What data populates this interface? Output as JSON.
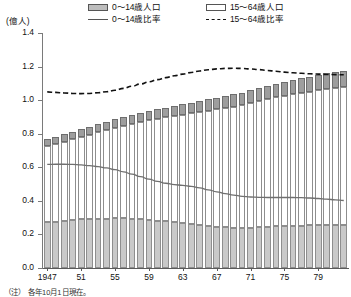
{
  "axis": {
    "unit_label": "(億人)",
    "y_ticks": [
      "1.4",
      "1.2",
      "1.0",
      "0.8",
      "0.6",
      "0.4",
      "0.2",
      "0.0"
    ],
    "x_ticks": [
      "1947",
      "51",
      "55",
      "59",
      "63",
      "67",
      "71",
      "75",
      "79"
    ]
  },
  "legend": {
    "items": [
      {
        "label": "0〜14歳人口",
        "icon": "filled-box-swatch"
      },
      {
        "label": "15〜64歳人口",
        "icon": "empty-box-swatch"
      },
      {
        "label": "0〜14歳比率",
        "icon": "solid-line-swatch"
      },
      {
        "label": "15〜64歳比率",
        "icon": "dashed-line-swatch"
      }
    ]
  },
  "note": {
    "text": "（注）　各年10月1日現在。"
  },
  "colors": {
    "bar_low_fill": "#c9c9c9",
    "bar_mid_fill": "#ffffff",
    "bar_top_fill": "#9e9e9e",
    "bar_stroke": "#8e8e8e",
    "line_solid": "#6f6f6f",
    "line_dashed": "#111111",
    "axis": "#5a5a5a"
  },
  "chart_data": {
    "type": "bar",
    "title": "",
    "subtitle": "",
    "xlabel": "",
    "ylabel": "(億人)",
    "ylim": [
      0.0,
      1.4
    ],
    "ytick_values": [
      0.0,
      0.2,
      0.4,
      0.6,
      0.8,
      1.0,
      1.2,
      1.4
    ],
    "grid": false,
    "legend_position": "top",
    "categories": [
      "1947",
      "1948",
      "1949",
      "1950",
      "1951",
      "1952",
      "1953",
      "1954",
      "1955",
      "1956",
      "1957",
      "1958",
      "1959",
      "1960",
      "1961",
      "1962",
      "1963",
      "1964",
      "1965",
      "1966",
      "1967",
      "1968",
      "1969",
      "1970",
      "1971",
      "1972",
      "1973",
      "1974",
      "1975",
      "1976",
      "1977",
      "1978",
      "1979",
      "1980",
      "1981",
      "1982"
    ],
    "series": [
      {
        "name": "0〜14歳人口",
        "type": "bar-segment",
        "unit": "億人",
        "values": [
          0.272,
          0.277,
          0.282,
          0.287,
          0.29,
          0.292,
          0.293,
          0.294,
          0.296,
          0.295,
          0.293,
          0.29,
          0.287,
          0.283,
          0.278,
          0.272,
          0.266,
          0.261,
          0.256,
          0.25,
          0.246,
          0.243,
          0.241,
          0.24,
          0.241,
          0.243,
          0.246,
          0.249,
          0.251,
          0.252,
          0.253,
          0.254,
          0.255,
          0.256,
          0.256,
          0.255
        ]
      },
      {
        "name": "15〜64歳人口",
        "type": "bar-segment",
        "unit": "億人",
        "values": [
          0.456,
          0.463,
          0.47,
          0.48,
          0.492,
          0.503,
          0.515,
          0.527,
          0.54,
          0.553,
          0.566,
          0.579,
          0.592,
          0.606,
          0.62,
          0.634,
          0.648,
          0.662,
          0.675,
          0.687,
          0.699,
          0.71,
          0.721,
          0.731,
          0.741,
          0.751,
          0.76,
          0.768,
          0.776,
          0.783,
          0.79,
          0.797,
          0.803,
          0.81,
          0.816,
          0.822
        ]
      },
      {
        "name": "65歳以上人口",
        "type": "bar-segment",
        "unit": "億人",
        "values": [
          0.042,
          0.043,
          0.044,
          0.045,
          0.046,
          0.047,
          0.048,
          0.049,
          0.05,
          0.051,
          0.052,
          0.054,
          0.055,
          0.057,
          0.058,
          0.06,
          0.062,
          0.063,
          0.065,
          0.067,
          0.069,
          0.071,
          0.073,
          0.074,
          0.076,
          0.078,
          0.08,
          0.082,
          0.084,
          0.086,
          0.088,
          0.09,
          0.092,
          0.094,
          0.096,
          0.098
        ]
      },
      {
        "name": "0〜14歳比率",
        "type": "line",
        "style": "solid",
        "unit": "指数",
        "values": [
          0.617,
          0.618,
          0.618,
          0.617,
          0.614,
          0.61,
          0.604,
          0.596,
          0.586,
          0.573,
          0.559,
          0.544,
          0.529,
          0.516,
          0.505,
          0.497,
          0.492,
          0.486,
          0.477,
          0.466,
          0.454,
          0.443,
          0.434,
          0.427,
          0.423,
          0.421,
          0.42,
          0.42,
          0.42,
          0.42,
          0.419,
          0.417,
          0.414,
          0.41,
          0.406,
          0.402
        ]
      },
      {
        "name": "15〜64歳比率",
        "type": "line",
        "style": "dashed",
        "unit": "指数",
        "values": [
          1.049,
          1.046,
          1.043,
          1.04,
          1.039,
          1.04,
          1.044,
          1.05,
          1.059,
          1.07,
          1.083,
          1.096,
          1.109,
          1.122,
          1.134,
          1.145,
          1.155,
          1.165,
          1.174,
          1.181,
          1.186,
          1.189,
          1.19,
          1.189,
          1.186,
          1.182,
          1.177,
          1.172,
          1.167,
          1.163,
          1.16,
          1.157,
          1.155,
          1.153,
          1.152,
          1.151
        ]
      }
    ]
  }
}
